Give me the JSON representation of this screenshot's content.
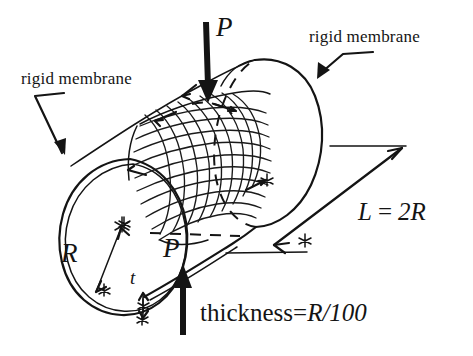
{
  "figure": {
    "kind": "hand-drawn engineering sketch",
    "background_color": "#ffffff",
    "ink_color": "#141414"
  },
  "labels": {
    "rigid_membrane_left": "rigid membrane",
    "rigid_membrane_right": "rigid membrane",
    "load_top": "P",
    "load_bottom": "P",
    "radius": "R",
    "thickness_symbol": "t",
    "length_equation": "L = 2R",
    "length_lhs": "L",
    "length_eq_sign": "=",
    "length_rhs": "2R",
    "thickness_note": "thickness=R/100",
    "thickness_note_prefix": "thickness=",
    "thickness_note_value": "R/100"
  },
  "annotations": {
    "load_direction_top": "downward arrow",
    "load_direction_bottom": "upward arrow",
    "radius_marker": "double-headed arrow from center to rim",
    "thickness_marker": "small double-headed arrow across wall",
    "length_marker": "double-headed dimension arrow along cylinder axis",
    "hidden_edges": "dashed",
    "deformed_patch": "cross-hatched mesh on upper surface"
  },
  "icons": {
    "arrow_down": "arrow-down-icon",
    "arrow_up": "arrow-up-icon",
    "arrow_double": "double-arrow-icon",
    "leader": "leader-line-icon"
  }
}
